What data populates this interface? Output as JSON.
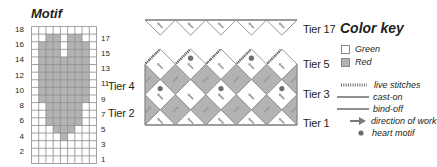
{
  "motif": {
    "title": "Motif",
    "cols": 9,
    "rows": 18,
    "left_row_numbers": [
      "18",
      "16",
      "14",
      "12",
      "10",
      "8",
      "6",
      "4",
      "2"
    ],
    "right_row_numbers": [
      "17",
      "15",
      "13",
      "11",
      "9",
      "7",
      "5",
      "3",
      "1"
    ],
    "filled_cells_by_row_from_top": [
      [],
      [
        3,
        4,
        6,
        7
      ],
      [
        2,
        3,
        4,
        6,
        7,
        8
      ],
      [
        2,
        3,
        4,
        6,
        7,
        8
      ],
      [
        2,
        3,
        4,
        5,
        6,
        7,
        8
      ],
      [
        2,
        3,
        4,
        5,
        6,
        7,
        8
      ],
      [
        2,
        3,
        4,
        5,
        6,
        7,
        8
      ],
      [
        2,
        3,
        4,
        5,
        6,
        7,
        8
      ],
      [
        2,
        3,
        4,
        5,
        6,
        7,
        8
      ],
      [
        2,
        3,
        4,
        5,
        6,
        7,
        8
      ],
      [
        3,
        4,
        5,
        6,
        7
      ],
      [
        3,
        4,
        5,
        6,
        7
      ],
      [
        3,
        4,
        5,
        6,
        7
      ],
      [
        4,
        5,
        6
      ],
      [
        5
      ],
      [],
      [],
      []
    ],
    "fill_color": "#b3b3b3",
    "grid_color": "#8a8a8a"
  },
  "diagram": {
    "tier_labels": {
      "tier17": "Tier 17",
      "tier5": "Tier 5",
      "tier4": "Tier 4",
      "tier3": "Tier 3",
      "tier2": "Tier 2",
      "tier1": "Tier 1"
    },
    "units": 5,
    "heart_motif_positions": [
      {
        "tier": 5,
        "index": 1
      },
      {
        "tier": 5,
        "index": 3
      },
      {
        "tier": 3,
        "index": 0
      },
      {
        "tier": 3,
        "index": 2
      },
      {
        "tier": 3,
        "index": 4
      }
    ],
    "colors": {
      "green": "#ffffff",
      "red": "#b3b3b3",
      "outline": "#8a8a8a",
      "arrow": "#9a9a9a",
      "dot": "#6d6d6d"
    }
  },
  "color_key": {
    "title": "Color key",
    "items": [
      {
        "label": "Green",
        "swatch": "#ffffff"
      },
      {
        "label": "Red",
        "swatch": "#b3b3b3"
      }
    ],
    "legend": [
      {
        "symbol": "live-stitches",
        "label": "live stitches"
      },
      {
        "symbol": "cast-on-line",
        "label": "cast-on"
      },
      {
        "symbol": "bind-off-line",
        "label": "bind-off"
      },
      {
        "symbol": "direction-arrow",
        "label": "direction of work"
      },
      {
        "symbol": "heart-dot",
        "label": "heart motif"
      }
    ]
  }
}
